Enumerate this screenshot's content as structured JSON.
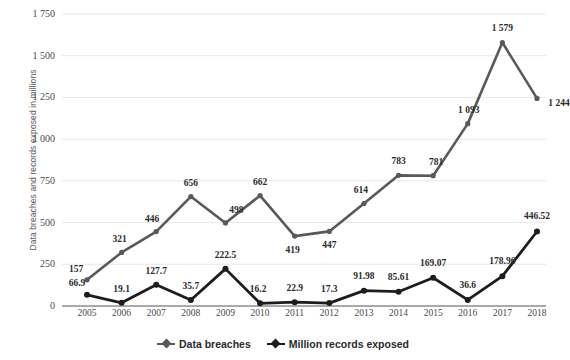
{
  "chart_data": {
    "type": "line",
    "title": "",
    "xlabel": "",
    "ylabel": "Data breaches and records exposed in millions",
    "categories": [
      "2005",
      "2006",
      "2007",
      "2008",
      "2009",
      "2010",
      "2011",
      "2012",
      "2013",
      "2014",
      "2015",
      "2016",
      "2017",
      "2018"
    ],
    "ylim": [
      0,
      1750
    ],
    "yticks": [
      0,
      250,
      500,
      750,
      1000,
      1250,
      1500,
      1750
    ],
    "ytick_labels": [
      "0",
      "250",
      "500",
      "750",
      "1 000",
      "1 250",
      "1 500",
      "1 750"
    ],
    "grid": true,
    "legend_position": "bottom",
    "series": [
      {
        "name": "Data breaches",
        "color": "#595959",
        "values": [
          157,
          321,
          446,
          656,
          498,
          662,
          419,
          447,
          614,
          783,
          781,
          1093,
          1579,
          1244
        ],
        "labels": [
          "157",
          "321",
          "446",
          "656",
          "498",
          "662",
          "419",
          "447",
          "614",
          "783",
          "781",
          "1 093",
          "1 579",
          "1 244"
        ]
      },
      {
        "name": "Million records exposed",
        "color": "#1d1d1d",
        "values": [
          66.9,
          19.1,
          127.7,
          35.7,
          222.5,
          16.2,
          22.9,
          17.3,
          91.98,
          85.61,
          169.07,
          36.6,
          178.96,
          446.52
        ],
        "labels": [
          "66.9",
          "19.1",
          "127.7",
          "35.7",
          "222.5",
          "16.2",
          "22.9",
          "17.3",
          "91.98",
          "85.61",
          "169.07",
          "36.6",
          "178.96",
          "446.52"
        ]
      }
    ]
  },
  "legend": {
    "items": [
      {
        "label": "Data breaches",
        "color": "#595959"
      },
      {
        "label": "Million records exposed",
        "color": "#1d1d1d"
      }
    ]
  },
  "axes": {
    "y_title": "Data breaches and records exposed in millions"
  },
  "colors": {
    "background": "#ffffff",
    "gridline": "#e8e8e8",
    "axisline": "#8c8c8c",
    "text": "#4a4a4a",
    "series_breaches": "#595959",
    "series_records": "#1d1d1d"
  }
}
